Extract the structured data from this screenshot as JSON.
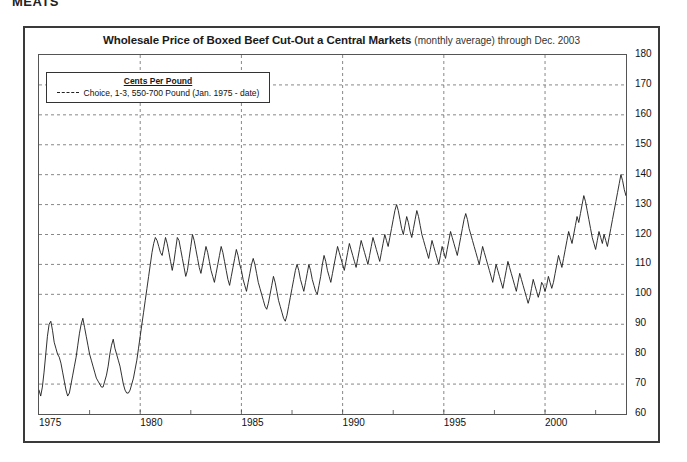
{
  "page": {
    "header_text": "MEATS"
  },
  "chart_title": {
    "main": "Wholesale Price of Boxed Beef Cut-Out a Central Markets",
    "sub": "(monthly average) through Dec. 2003"
  },
  "legend": {
    "title": "Cents Per Pound",
    "series_label": "Choice, 1-3, 550-700 Pound (Jan. 1975 - date)",
    "swatch_name": "dashed-line-swatch"
  },
  "chart_data": {
    "type": "line",
    "title": "Wholesale Price of Boxed Beef Cut-Out a Central Markets (monthly average) through Dec. 2003",
    "xlabel": "",
    "ylabel": "Cents Per Pound",
    "xlim": [
      1975.0,
      2004.0
    ],
    "ylim": [
      60,
      180
    ],
    "yticks": [
      60,
      70,
      80,
      90,
      100,
      110,
      120,
      130,
      140,
      150,
      160,
      170,
      180
    ],
    "xticks": [
      1975,
      1980,
      1985,
      1990,
      1995,
      2000
    ],
    "xtick_labels": [
      "1975",
      "1980",
      "1985",
      "1990",
      "1995",
      "2000"
    ],
    "grid": "dashed-horizontal-and-vertical",
    "legend_position": "top-left-inside",
    "line_color": "#1a1a1a",
    "series": [
      {
        "name": "Choice, 1-3, 550-700 Pound (Jan. 1975 - date)",
        "x_start": 1975.0,
        "x_step": 0.08333,
        "values": [
          68,
          66,
          69,
          74,
          80,
          86,
          90,
          91,
          88,
          84,
          82,
          80,
          79,
          77,
          74,
          71,
          68,
          66,
          67,
          70,
          73,
          76,
          79,
          83,
          87,
          90,
          92,
          89,
          86,
          83,
          80,
          78,
          76,
          74,
          72,
          71,
          70,
          69,
          69,
          71,
          73,
          76,
          80,
          83,
          85,
          82,
          80,
          78,
          76,
          73,
          70,
          68,
          67,
          67,
          68,
          70,
          72,
          75,
          78,
          82,
          86,
          90,
          94,
          98,
          102,
          106,
          110,
          114,
          117,
          119,
          118,
          116,
          114,
          113,
          116,
          119,
          117,
          114,
          111,
          108,
          111,
          115,
          119,
          118,
          115,
          112,
          109,
          106,
          108,
          112,
          116,
          120,
          118,
          115,
          112,
          109,
          107,
          110,
          113,
          116,
          114,
          111,
          108,
          106,
          104,
          107,
          110,
          113,
          116,
          114,
          111,
          108,
          105,
          103,
          106,
          109,
          112,
          115,
          113,
          110,
          108,
          105,
          103,
          101,
          104,
          107,
          110,
          112,
          110,
          107,
          104,
          102,
          100,
          98,
          96,
          95,
          97,
          100,
          103,
          106,
          104,
          101,
          98,
          96,
          94,
          92,
          91,
          93,
          96,
          99,
          102,
          105,
          108,
          110,
          108,
          105,
          103,
          101,
          104,
          107,
          110,
          108,
          105,
          103,
          101,
          100,
          103,
          106,
          110,
          113,
          111,
          108,
          106,
          104,
          107,
          110,
          113,
          116,
          114,
          112,
          110,
          108,
          111,
          114,
          117,
          115,
          113,
          111,
          109,
          112,
          115,
          118,
          116,
          114,
          112,
          110,
          113,
          116,
          119,
          117,
          115,
          113,
          111,
          114,
          117,
          120,
          118,
          116,
          119,
          122,
          125,
          128,
          130,
          128,
          125,
          122,
          120,
          123,
          126,
          124,
          121,
          119,
          122,
          125,
          128,
          126,
          123,
          120,
          118,
          116,
          114,
          112,
          115,
          118,
          116,
          114,
          112,
          110,
          113,
          116,
          114,
          112,
          115,
          118,
          121,
          119,
          117,
          115,
          113,
          116,
          119,
          122,
          125,
          127,
          125,
          122,
          120,
          118,
          116,
          114,
          112,
          110,
          113,
          116,
          114,
          112,
          110,
          108,
          106,
          104,
          107,
          110,
          108,
          106,
          104,
          102,
          105,
          108,
          111,
          109,
          107,
          105,
          103,
          101,
          104,
          107,
          105,
          103,
          101,
          99,
          97,
          99,
          102,
          105,
          103,
          101,
          99,
          101,
          104,
          103,
          101,
          103,
          106,
          104,
          102,
          104,
          107,
          110,
          113,
          111,
          109,
          112,
          115,
          118,
          121,
          119,
          117,
          120,
          123,
          126,
          124,
          127,
          130,
          133,
          131,
          128,
          125,
          122,
          119,
          117,
          115,
          118,
          121,
          119,
          117,
          120,
          118,
          116,
          119,
          122,
          125,
          128,
          131,
          134,
          137,
          140,
          138,
          135,
          133,
          136,
          139,
          142,
          150,
          160,
          170,
          176,
          168,
          160,
          157,
          157
        ]
      }
    ]
  },
  "axes": {
    "y_tick_labels": [
      "180",
      "170",
      "160",
      "150",
      "140",
      "130",
      "120",
      "110",
      "100",
      "90",
      "80",
      "70",
      "60"
    ],
    "x_tick_labels": [
      "1975",
      "1980",
      "1985",
      "1990",
      "1995",
      "2000"
    ]
  }
}
